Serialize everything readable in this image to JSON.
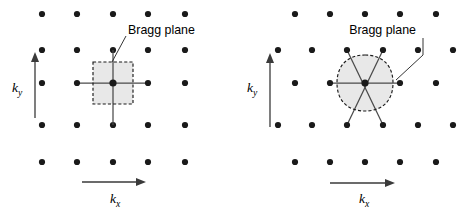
{
  "figure": {
    "background_color": "#ffffff",
    "dot_color": "#1a1a1a",
    "zone_fill_color": "#e8e8e8",
    "zone_edge_color": "#1a1a1a",
    "bragg_line_color": "#4a4a4a",
    "axis_color": "#3a3a3a",
    "text_color": "#000000"
  },
  "panels": [
    {
      "id": "left",
      "lattice_type": "square",
      "zone_shape": "square",
      "callout": {
        "text": "Bragg plane",
        "x": 128,
        "y": 34,
        "leader": "M 126 36 L 112 62"
      },
      "axes": {
        "ky": {
          "label_k": "k",
          "label_sub": "y",
          "label_x": 12,
          "label_y": 92,
          "shaft": "M 35 118 L 35 59",
          "arrow": "35,52 31,62 39,62"
        },
        "kx": {
          "label_k": "k",
          "label_sub": "x",
          "label_x": 110,
          "label_y": 203,
          "shaft": "M 82 182 L 138 182",
          "arrow": "146,182 136,178 136,186"
        }
      },
      "lattice_rows": [
        {
          "y": 14,
          "xs": [
            42,
            77,
            113,
            148,
            185
          ]
        },
        {
          "y": 50,
          "xs": [
            42,
            77,
            113,
            148,
            185
          ]
        },
        {
          "y": 83,
          "xs": [
            42,
            77,
            113,
            148,
            185
          ]
        },
        {
          "y": 125,
          "xs": [
            42,
            77,
            113,
            148,
            185
          ]
        },
        {
          "y": 162,
          "xs": [
            42,
            77,
            113,
            148,
            185
          ]
        }
      ],
      "dot_radius": 3.1,
      "center": {
        "x": 113,
        "y": 83
      },
      "center_dot_radius": 3.6,
      "zone_rect": {
        "x": 93,
        "y": 62,
        "width": 40,
        "height": 42
      },
      "bragg_lines": [
        "M 77 83 L 148 83",
        "M 113 50 L 113 125"
      ]
    },
    {
      "id": "right",
      "lattice_type": "triangular",
      "zone_shape": "rounded-hexagon",
      "callout": {
        "text": "Bragg plane",
        "x": 179,
        "y": 34,
        "leader": "M 186 38 L 186 55 L 159 80"
      },
      "axes": {
        "ky": {
          "label_k": "k",
          "label_sub": "y",
          "label_x": 10,
          "label_y": 92,
          "shaft": "M 33 127 L 33 60",
          "arrow": "33,53 29,63 37,63"
        },
        "kx": {
          "label_k": "k",
          "label_sub": "x",
          "label_x": 122,
          "label_y": 203,
          "shaft": "M 93 183 L 150 183",
          "arrow": "158,183 148,179 148,187"
        }
      },
      "lattice_rows": [
        {
          "y": 14,
          "xs": [
            58,
            93,
            128,
            163,
            199
          ]
        },
        {
          "y": 50,
          "xs": [
            41,
            75,
            110,
            146,
            181,
            216
          ]
        },
        {
          "y": 83,
          "xs": [
            58,
            93,
            128,
            163,
            199
          ]
        },
        {
          "y": 125,
          "xs": [
            41,
            75,
            110,
            146,
            181,
            216
          ]
        },
        {
          "y": 162,
          "xs": [
            58,
            93,
            128,
            163,
            199
          ]
        }
      ],
      "dot_radius": 3.1,
      "center": {
        "x": 128,
        "y": 83
      },
      "center_dot_radius": 3.6,
      "zone_path": "M 128 55 C 144 55 156 64 156 83 C 156 102 144 111 128 111 C 112 111 100 102 100 83 C 100 64 112 55 128 55 Z",
      "bragg_lines": [
        "M 93 83 L 163 83",
        "M 110 50 L 146 125",
        "M 146 50 L 110 125"
      ]
    }
  ]
}
